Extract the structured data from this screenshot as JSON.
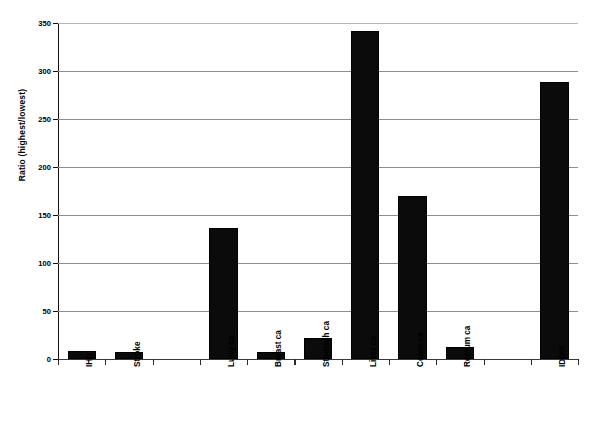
{
  "chart_data": {
    "type": "bar",
    "title": "",
    "subtitle": "",
    "xlabel": "",
    "ylabel": "Ratio (highest/lowest)",
    "ylim": [
      0,
      350
    ],
    "yticks": [
      0,
      50,
      100,
      150,
      200,
      250,
      300,
      350
    ],
    "ytick_labels": [
      "0",
      "50",
      "100",
      "150",
      "200",
      "250",
      "300",
      "350"
    ],
    "grid": "horizontal",
    "legend": "none",
    "bar_color": "#0b0b0b",
    "categories": [
      "IHD",
      "Stroke",
      "Lung ca",
      "Breast ca",
      "Stomach ca",
      "Liver ca",
      "Colon ca",
      "Rectum ca",
      "IDDM"
    ],
    "values": [
      8,
      7,
      136,
      7,
      22,
      342,
      170,
      13,
      289
    ],
    "slot_indices": [
      0,
      1,
      3,
      4,
      5,
      6,
      7,
      8,
      10
    ],
    "slot_count": 11,
    "annotations": []
  },
  "axis": {
    "y_title": "Ratio (highest/lowest)"
  }
}
